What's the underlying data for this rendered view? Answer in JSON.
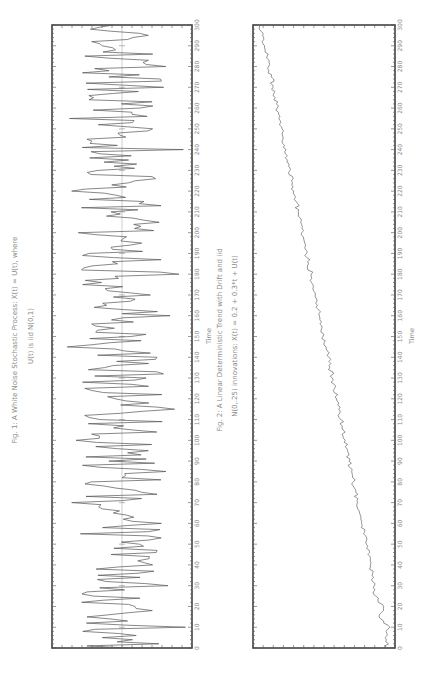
{
  "figures": [
    {
      "caption_line1": "Fig. 1: A White Noise Stochastic Process: X(t) = U(t), where",
      "caption_line2": "U(t) is iid N(0,1)",
      "xlabel": "Time"
    },
    {
      "caption_line1": "Fig. 2: A Linear Deterministic Trend with Drift and iid",
      "caption_line2": "N(0,.25) innovations: X(t) = 0.2 + 0.3*t + U(t)",
      "xlabel": "Time"
    }
  ],
  "chart_data": [
    {
      "type": "line",
      "title": "Fig. 1: A White Noise Stochastic Process: X(t) = U(t), where U(t) is iid N(0,1)",
      "xlabel": "Time",
      "ylabel": "",
      "orientation": "rotated 90 degrees counter-clockwise (time axis runs bottom-to-top)",
      "xlim": [
        0,
        300
      ],
      "ylim": [
        -3.2,
        3.2
      ],
      "x_ticks": [
        0,
        10,
        20,
        30,
        40,
        50,
        60,
        70,
        80,
        90,
        100,
        110,
        120,
        130,
        140,
        150,
        160,
        170,
        180,
        190,
        200,
        210,
        220,
        230,
        240,
        250,
        260,
        270,
        280,
        290,
        300
      ],
      "zero_reference_line": true,
      "grid": false,
      "x": [
        0,
        5,
        10,
        15,
        20,
        25,
        30,
        35,
        40,
        45,
        50,
        55,
        60,
        65,
        70,
        75,
        80,
        85,
        90,
        95,
        100,
        105,
        110,
        115,
        120,
        125,
        130,
        135,
        140,
        145,
        150,
        155,
        160,
        165,
        170,
        175,
        180,
        185,
        190,
        195,
        200,
        205,
        210,
        215,
        220,
        225,
        230,
        235,
        240,
        245,
        250,
        255,
        260,
        265,
        270,
        275,
        280,
        285,
        290,
        295,
        300
      ],
      "values": [
        -0.3,
        0.9,
        -2.9,
        1.6,
        -0.6,
        1.3,
        -2.1,
        1.1,
        -1.4,
        0.5,
        -0.8,
        1.9,
        -1.8,
        0.4,
        2.3,
        -0.9,
        1.4,
        -2.0,
        0.6,
        -1.2,
        2.1,
        -0.5,
        1.0,
        -2.4,
        0.3,
        1.7,
        -1.1,
        0.8,
        -1.6,
        2.5,
        -0.4,
        1.2,
        -2.2,
        0.7,
        -1.3,
        1.8,
        -2.6,
        0.2,
        1.5,
        -0.9,
        2.0,
        -1.7,
        0.5,
        -1.0,
        2.3,
        -0.6,
        1.1,
        -0.3,
        -2.8,
        1.6,
        -1.4,
        2.4,
        -0.8,
        1.3,
        -1.9,
        0.6,
        -2.0,
        1.7,
        0.9,
        -1.2,
        0.4
      ]
    },
    {
      "type": "line",
      "title": "Fig. 2: A Linear Deterministic Trend with Drift and iid N(0,.25) innovations: X(t) = 0.2 + 0.3*t + U(t)",
      "xlabel": "Time",
      "ylabel": "",
      "orientation": "rotated 90 degrees counter-clockwise (time axis runs bottom-to-top)",
      "xlim": [
        0,
        300
      ],
      "ylim": [
        -5,
        95
      ],
      "x_ticks": [
        0,
        10,
        20,
        30,
        40,
        50,
        60,
        70,
        80,
        90,
        100,
        110,
        120,
        130,
        140,
        150,
        160,
        170,
        180,
        190,
        200,
        210,
        220,
        230,
        240,
        250,
        260,
        270,
        280,
        290,
        300
      ],
      "grid": false,
      "x": [
        0,
        5,
        10,
        15,
        20,
        25,
        30,
        35,
        40,
        45,
        50,
        55,
        60,
        65,
        70,
        75,
        80,
        85,
        90,
        95,
        100,
        105,
        110,
        115,
        120,
        125,
        130,
        135,
        140,
        145,
        150,
        155,
        160,
        165,
        170,
        175,
        180,
        185,
        190,
        195,
        200,
        205,
        210,
        215,
        220,
        225,
        230,
        235,
        240,
        245,
        250,
        255,
        260,
        265,
        270,
        275,
        280,
        285,
        290,
        295,
        300
      ],
      "values": [
        0.5,
        1.8,
        -1.5,
        6.2,
        3.0,
        8.5,
        9.6,
        11.1,
        12.4,
        14.0,
        15.2,
        17.1,
        18.6,
        19.9,
        21.5,
        22.7,
        24.4,
        25.5,
        27.3,
        28.4,
        30.1,
        31.7,
        33.0,
        34.6,
        36.3,
        37.5,
        39.2,
        40.9,
        41.6,
        43.5,
        45.8,
        46.4,
        48.3,
        49.7,
        51.2,
        52.8,
        54.0,
        55.9,
        57.3,
        58.5,
        60.6,
        61.4,
        63.2,
        64.5,
        66.3,
        67.8,
        68.9,
        70.8,
        71.7,
        73.9,
        74.6,
        76.8,
        78.0,
        79.3,
        80.9,
        82.2,
        84.0,
        85.1,
        86.9,
        88.2,
        90.1
      ]
    }
  ]
}
